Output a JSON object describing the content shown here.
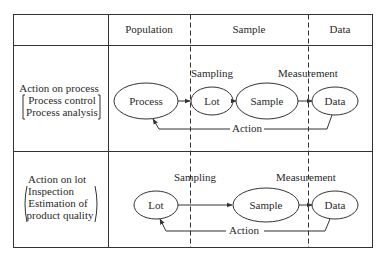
{
  "header": {
    "col_blank": "",
    "col_population": "Population",
    "col_sample": "Sample",
    "col_data": "Data"
  },
  "rows": [
    {
      "title": "Action on process",
      "sub": [
        "Process control",
        "Process analysis"
      ],
      "nodes": [
        "Process",
        "Lot",
        "Sample",
        "Data"
      ],
      "edge_labels": {
        "sampling": "Sampling",
        "measurement": "Measurement",
        "action": "Action"
      }
    },
    {
      "title": "Action on lot",
      "sub": [
        "Inspection",
        "Estimation of",
        "product quality"
      ],
      "nodes": [
        "Lot",
        "Sample",
        "Data"
      ],
      "edge_labels": {
        "sampling": "Sampling",
        "measurement": "Measurement",
        "action": "Action"
      }
    }
  ],
  "colors": {
    "line": "#333333",
    "background": "#ffffff"
  }
}
